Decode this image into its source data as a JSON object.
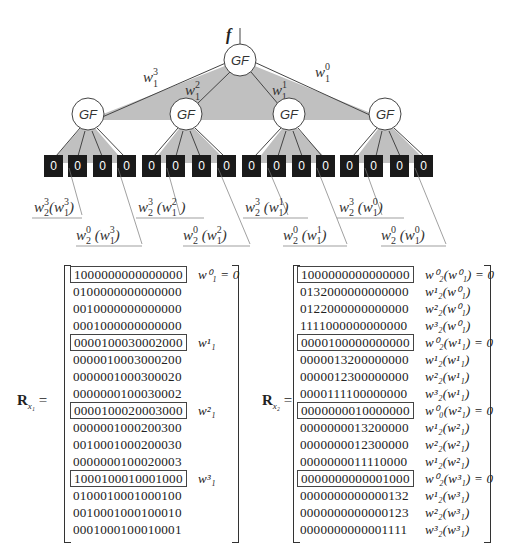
{
  "diagram": {
    "root": {
      "label": "GF",
      "input_label": "f"
    },
    "level1_edges": [
      {
        "label": "w",
        "sup": "3",
        "sub": "1"
      },
      {
        "label": "w",
        "sup": "2",
        "sub": "1"
      },
      {
        "label": "w",
        "sup": "1",
        "sub": "1"
      },
      {
        "label": "w",
        "sup": "0",
        "sub": "1"
      }
    ],
    "level1_nodes": [
      "GF",
      "GF",
      "GF",
      "GF"
    ],
    "leaves": [
      "0",
      "0",
      "0",
      "0",
      "0",
      "0",
      "0",
      "0",
      "0",
      "0",
      "0",
      "0",
      "0",
      "0",
      "0",
      "0"
    ],
    "leaf_annotations": [
      {
        "upper": "w³₂(w³₁)",
        "lower": "w⁰₂(w³₁)"
      },
      {
        "upper": "w³₂(w²₁)",
        "lower": "w⁰₂(w²₁)"
      },
      {
        "upper": "w³₂(w¹₁)",
        "lower": "w⁰₂(w¹₁)"
      },
      {
        "upper": "w³₂(w⁰₁)",
        "lower": "w⁰₂(w⁰₁)"
      }
    ],
    "colors": {
      "fill": "#c0c0c0",
      "leaf": "#1a1a1a",
      "edge": "#444444"
    }
  },
  "matrix_x1": {
    "label": "R",
    "label_sub": "x₁",
    "rows": [
      {
        "bits": "1000000000000000",
        "boxed": true,
        "annotation": "w⁰₁ = 0"
      },
      {
        "bits": "0100000000000000",
        "boxed": false,
        "annotation": ""
      },
      {
        "bits": "0010000000000000",
        "boxed": false,
        "annotation": ""
      },
      {
        "bits": "0001000000000000",
        "boxed": false,
        "annotation": ""
      },
      {
        "bits": "0000100030002000",
        "boxed": true,
        "annotation": "w¹₁"
      },
      {
        "bits": "0000010003000200",
        "boxed": false,
        "annotation": ""
      },
      {
        "bits": "0000001000300020",
        "boxed": false,
        "annotation": ""
      },
      {
        "bits": "0000000100030002",
        "boxed": false,
        "annotation": ""
      },
      {
        "bits": "0000100020003000",
        "boxed": true,
        "annotation": "w²₁"
      },
      {
        "bits": "0000001000200300",
        "boxed": false,
        "annotation": ""
      },
      {
        "bits": "0010001000200030",
        "boxed": false,
        "annotation": ""
      },
      {
        "bits": "0000000100020003",
        "boxed": false,
        "annotation": ""
      },
      {
        "bits": "1000100010001000",
        "boxed": true,
        "annotation": "w³₁"
      },
      {
        "bits": "0100010001000100",
        "boxed": false,
        "annotation": ""
      },
      {
        "bits": "0010001000100010",
        "boxed": false,
        "annotation": ""
      },
      {
        "bits": "0001000100010001",
        "boxed": false,
        "annotation": ""
      }
    ]
  },
  "matrix_x2": {
    "label": "R",
    "label_sub": "x₂",
    "rows": [
      {
        "bits": "1000000000000000",
        "boxed": true,
        "annotation": "w⁰₂(w⁰₁) = 0"
      },
      {
        "bits": "0132000000000000",
        "boxed": false,
        "annotation": "w¹₂(w⁰₁)"
      },
      {
        "bits": "0122000000000000",
        "boxed": false,
        "annotation": "w²₂(w⁰₁)"
      },
      {
        "bits": "1111000000000000",
        "boxed": false,
        "annotation": "w³₂(w⁰₁)"
      },
      {
        "bits": "0000100000000000",
        "boxed": true,
        "annotation": "w⁰₂(w¹₁) = 0"
      },
      {
        "bits": "0000013200000000",
        "boxed": false,
        "annotation": "w¹₂(w¹₁)"
      },
      {
        "bits": "0000012300000000",
        "boxed": false,
        "annotation": "w²₂(w¹₁)"
      },
      {
        "bits": "0000111100000000",
        "boxed": false,
        "annotation": "w³₂(w¹₁)"
      },
      {
        "bits": "0000000010000000",
        "boxed": true,
        "annotation": "w⁰₀(w²₁) = 0"
      },
      {
        "bits": "0000000013200000",
        "boxed": false,
        "annotation": "w¹₂(w²₁)"
      },
      {
        "bits": "0000000012300000",
        "boxed": false,
        "annotation": "w²₂(w²₁)"
      },
      {
        "bits": "0000000011110000",
        "boxed": false,
        "annotation": "w¹₂(w²₁)"
      },
      {
        "bits": "0000000000001000",
        "boxed": true,
        "annotation": "w⁰₂(w³₁) = 0"
      },
      {
        "bits": "0000000000000132",
        "boxed": false,
        "annotation": "w¹₂(w³₁)"
      },
      {
        "bits": "0000000000000123",
        "boxed": false,
        "annotation": "w²₂(w³₁)"
      },
      {
        "bits": "0000000000001111",
        "boxed": false,
        "annotation": "w³₂(w³₁)"
      }
    ]
  }
}
